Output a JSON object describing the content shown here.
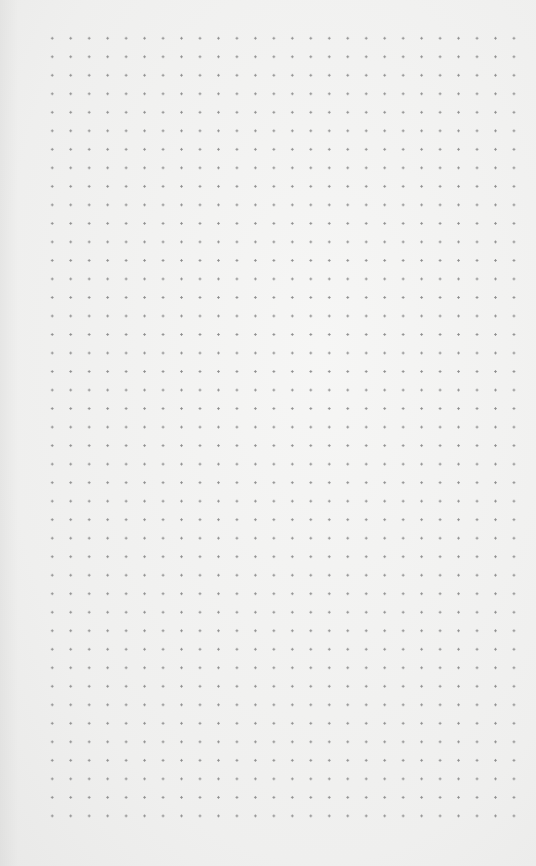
{
  "page": {
    "type": "dot-grid paper",
    "background_color": "#f0f0ef",
    "dot_color": "#8d8d8d"
  },
  "grid": {
    "columns": 27,
    "rows": 44,
    "spacing_px": 18.5,
    "first_dot": {
      "x": 44,
      "y": 30
    },
    "last_dot": {
      "x": 524,
      "y": 827
    }
  }
}
